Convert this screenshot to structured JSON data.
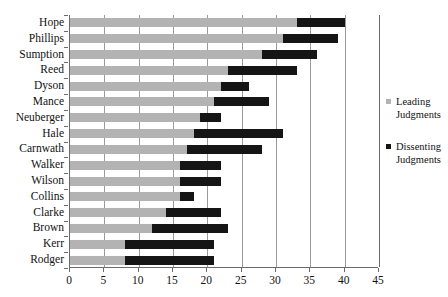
{
  "chart_data": {
    "type": "bar",
    "orientation": "horizontal",
    "stacked": true,
    "title": "",
    "subtitle": "",
    "xlabel": "",
    "ylabel": "",
    "xlim": [
      0,
      45
    ],
    "ylim": null,
    "grid": "vertical",
    "xticks": [
      0,
      5,
      10,
      15,
      20,
      25,
      30,
      35,
      40,
      45
    ],
    "xticklabels": [
      "0",
      "5",
      "10",
      "15",
      "20",
      "25",
      "30",
      "35",
      "40",
      "45"
    ],
    "legend_position": "right",
    "categories": [
      "Hope",
      "Phillips",
      "Sumption",
      "Reed",
      "Dyson",
      "Mance",
      "Neuberger",
      "Hale",
      "Carnwath",
      "Walker",
      "Wilson",
      "Collins",
      "Clarke",
      "Brown",
      "Kerr",
      "Rodger"
    ],
    "series": [
      {
        "name": "Leading Judgments",
        "color": "#b3b3b3",
        "values": [
          33,
          31,
          28,
          23,
          22,
          21,
          19,
          18,
          17,
          16,
          16,
          16,
          14,
          12,
          8,
          8
        ]
      },
      {
        "name": "Dissenting Judgments",
        "color": "#151515",
        "values": [
          7,
          8,
          8,
          10,
          4,
          8,
          3,
          13,
          11,
          6,
          6,
          2,
          8,
          11,
          13,
          13
        ]
      }
    ],
    "cumulative_totals": [
      40,
      39,
      36,
      33,
      26,
      29,
      22,
      31,
      28,
      22,
      22,
      18,
      22,
      23,
      21,
      21
    ]
  },
  "legend": {
    "entries": [
      {
        "label_line1": "Leading",
        "label_line2": "Judgments",
        "swatch": "leading-swatch"
      },
      {
        "label_line1": "Dissenting",
        "label_line2": "Judgments",
        "swatch": "dissenting-swatch"
      }
    ]
  },
  "colors": {
    "leading": "#b3b3b3",
    "dissenting": "#151515",
    "axis": "#6b6b6b",
    "gridline": "#9a9a9a",
    "background": "#ffffff",
    "text": "#111111"
  }
}
